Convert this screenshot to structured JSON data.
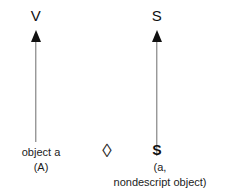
{
  "diagram": {
    "background_color": "#ffffff",
    "ink_color": "#1a1a1a",
    "shaft_color": "#6e6e6e",
    "arrows": [
      {
        "id": "left-arrow",
        "head_label": "V",
        "direction": "up",
        "caption_line_1": "object a",
        "caption_line_2": "(A)"
      },
      {
        "id": "right-arrow",
        "head_label": "S",
        "direction": "up",
        "base_symbol": "S",
        "caption_line_1": "(a,",
        "caption_line_2": "nondescript object)"
      }
    ],
    "middle_symbol": "◊"
  }
}
